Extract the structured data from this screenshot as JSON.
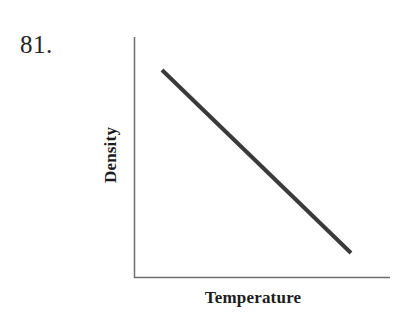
{
  "problem": {
    "number_label": "81."
  },
  "chart_data": {
    "type": "line",
    "title": "",
    "subtitle": "",
    "xlabel": "Temperature",
    "ylabel": "Density",
    "grid": false,
    "legend": null,
    "axis_ticks": {
      "x": [],
      "y": []
    },
    "xlim": [
      0,
      1
    ],
    "ylim": [
      0,
      1
    ],
    "relationship": "negative linear (density decreases as temperature increases)",
    "series": [
      {
        "name": "Density vs Temperature",
        "color": "#3a3a3a",
        "line_width_px": 4,
        "x": [
          0.11,
          1.0
        ],
        "y": [
          0.86,
          0.1
        ],
        "points_px": [
          {
            "x": 162,
            "y": 70
          },
          {
            "x": 351,
            "y": 253
          }
        ]
      }
    ],
    "axes_style": {
      "color": "#6e6e6e",
      "width_px": 1.5,
      "spines": [
        "left",
        "bottom"
      ]
    },
    "axes_px": {
      "left": 134,
      "top": 37,
      "bottom": 278,
      "right": 390
    }
  },
  "colors": {
    "background": "#ffffff",
    "line": "#3a3a3a",
    "axis": "#6e6e6e",
    "text": "#1c1c1c",
    "number_text": "#262626"
  }
}
